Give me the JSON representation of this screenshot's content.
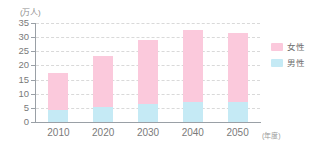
{
  "chart_data": {
    "type": "bar",
    "stacked": true,
    "title": "",
    "subtitle": "",
    "xlabel": "(年度)",
    "ylabel": "(万人)",
    "categories": [
      "2010",
      "2020",
      "2030",
      "2040",
      "2050"
    ],
    "series": [
      {
        "name": "男性",
        "color": "#c5eaf5",
        "values": [
          4.3,
          5.4,
          6.4,
          6.9,
          6.9
        ]
      },
      {
        "name": "女性",
        "color": "#fbc9dc",
        "values": [
          13.2,
          18.1,
          22.6,
          25.6,
          24.6
        ]
      }
    ],
    "totals": [
      17.5,
      23.5,
      29.0,
      32.5,
      31.5
    ],
    "ylim": [
      0,
      35
    ],
    "y_ticks": [
      "0",
      "5",
      "10",
      "15",
      "20",
      "25",
      "30",
      "35"
    ],
    "y_tick_values": [
      0,
      5,
      10,
      15,
      20,
      25,
      30,
      35
    ],
    "grid": true,
    "grid_style": "dashed-horizontal",
    "legend_position": "right",
    "legend": [
      {
        "label": "女性",
        "color": "#fbc9dc"
      },
      {
        "label": "男性",
        "color": "#c5eaf5"
      }
    ],
    "axis_color": "#9aa0a6",
    "grid_color": "#d9d9d9",
    "background": "#ffffff"
  }
}
